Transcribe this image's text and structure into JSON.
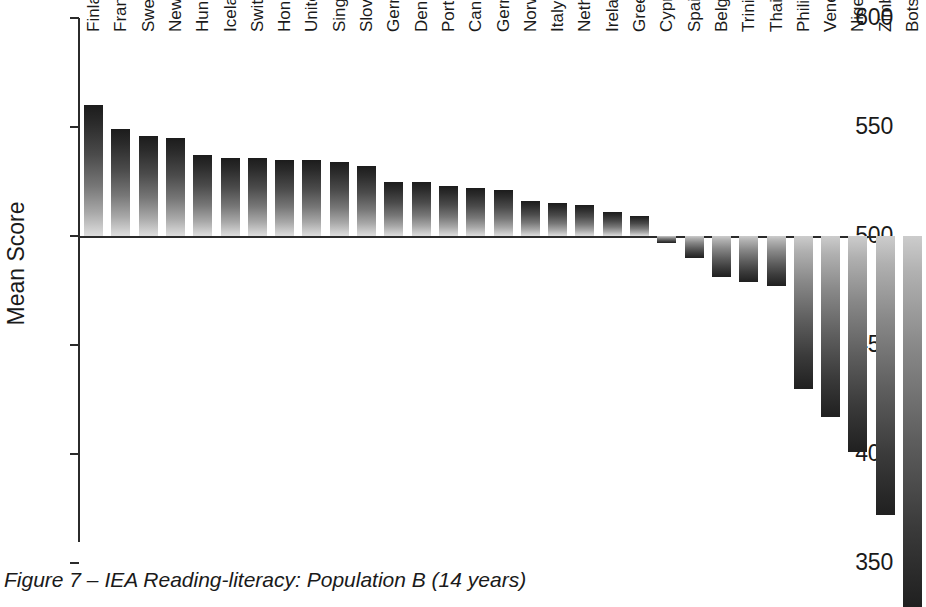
{
  "figure": {
    "caption": "Figure 7 – IEA Reading-literacy: Population B (14 years)"
  },
  "chart_data": {
    "type": "bar",
    "title": "",
    "subtitle": "",
    "xlabel": "",
    "ylabel": "Mean Score",
    "ylim": [
      350,
      600
    ],
    "yticks": [
      600,
      550,
      500,
      450,
      400,
      350
    ],
    "ytick_labels": [
      "600",
      "550",
      "500",
      "450",
      "400",
      "350"
    ],
    "baseline": 500,
    "grid": false,
    "legend": "none",
    "orientation": "vertical",
    "note": "Bars drawn from the 500 baseline; values above 500 rise, values below 500 descend. Last bar (Botswana) is clipped by the bottom edge of the figure.",
    "categories": [
      "Finland",
      "France",
      "Sweden",
      "New Zealand",
      "Hungary",
      "Iceland",
      "Switzerland",
      "Hong Kong",
      "United States",
      "Singapore",
      "Slovenia",
      "Germany/E",
      "Denmark",
      "Portugal",
      "Canada/BC",
      "Germany/W",
      "Norway",
      "Italy",
      "Netherlands",
      "Ireland",
      "Greece",
      "Cyprus",
      "Spain",
      "Belgium/Fr",
      "Trinidad/Tobago",
      "Thailand",
      "Philippines",
      "Venezuela",
      "Nigeria",
      "Zimbabwe",
      "Botswana"
    ],
    "values": [
      560,
      549,
      546,
      545,
      537,
      536,
      536,
      535,
      535,
      534,
      532,
      525,
      525,
      523,
      522,
      521,
      516,
      515,
      514,
      511,
      509,
      497,
      490,
      481,
      479,
      477,
      430,
      417,
      401,
      372,
      330
    ],
    "series": [
      {
        "name": "Mean Score",
        "values": [
          560,
          549,
          546,
          545,
          537,
          536,
          536,
          535,
          535,
          534,
          532,
          525,
          525,
          523,
          522,
          521,
          516,
          515,
          514,
          511,
          509,
          497,
          490,
          481,
          479,
          477,
          430,
          417,
          401,
          372,
          330
        ]
      }
    ]
  }
}
